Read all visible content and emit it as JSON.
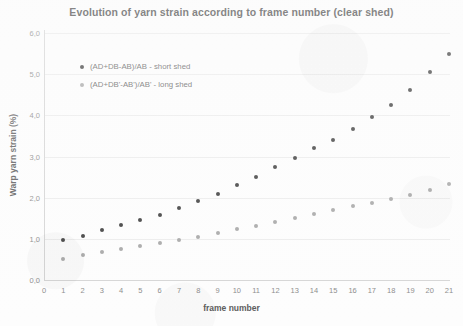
{
  "chart_data": {
    "type": "scatter",
    "title": "Evolution of yarn strain according to frame number (clear shed)",
    "xlabel": "frame number",
    "ylabel": "Warp yarn strain (%)",
    "xlim": [
      0,
      21
    ],
    "ylim": [
      0.0,
      6.0
    ],
    "xticks": [
      "0",
      "1",
      "2",
      "3",
      "4",
      "5",
      "6",
      "7",
      "8",
      "9",
      "10",
      "11",
      "12",
      "13",
      "14",
      "15",
      "16",
      "17",
      "18",
      "19",
      "20",
      "21"
    ],
    "yticks": [
      "0,0",
      "1,0",
      "2,0",
      "3,0",
      "4,0",
      "5,0",
      "6,0"
    ],
    "ytick_values": [
      0,
      1,
      2,
      3,
      4,
      5,
      6
    ],
    "grid": true,
    "legend_position": "inside-upper-left",
    "decimal_separator": ",",
    "x": [
      1,
      2,
      3,
      4,
      5,
      6,
      7,
      8,
      9,
      10,
      11,
      12,
      13,
      14,
      15,
      16,
      17,
      18,
      19,
      20,
      21
    ],
    "series": [
      {
        "name": "(AD+DB-AB)/AB - short shed",
        "color": "#3b3b3b",
        "values": [
          0.97,
          1.07,
          1.21,
          1.33,
          1.45,
          1.58,
          1.76,
          1.92,
          2.1,
          2.3,
          2.5,
          2.74,
          2.97,
          3.2,
          3.41,
          3.66,
          3.96,
          4.26,
          4.62,
          5.05,
          5.49
        ]
      },
      {
        "name": "(AD+DB'-AB')/AB' - long shed",
        "color": "#a6a6a6",
        "values": [
          0.52,
          0.6,
          0.67,
          0.76,
          0.83,
          0.9,
          0.98,
          1.05,
          1.13,
          1.24,
          1.31,
          1.4,
          1.5,
          1.6,
          1.7,
          1.8,
          1.87,
          1.97,
          2.06,
          2.18,
          2.33
        ]
      }
    ]
  }
}
